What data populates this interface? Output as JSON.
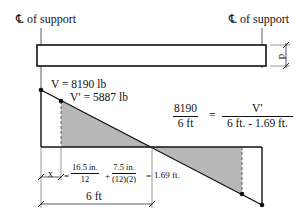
{
  "labels": {
    "left_support": "℄ of support",
    "right_support": "℄ of support",
    "depth": "d",
    "v_max": "V = 8190 lb",
    "v_prime": "V′ = 5887 lb",
    "x_label": "x",
    "span_label": "6 ft"
  },
  "equation_ratio": {
    "lhs_num": "8190",
    "lhs_den": "6 ft",
    "equals": "=",
    "rhs_num": "V′",
    "rhs_den": "6 ft. - 1.69 ft."
  },
  "equation_x": {
    "eq1": "=",
    "f1_num": "16.5 in.",
    "f1_den": "12",
    "plus": "+",
    "f2_num": "7.5 in.",
    "f2_den": "(12)(2)",
    "eq2": "=",
    "result": "1.69 ft."
  },
  "colors": {
    "line": "#111111",
    "shade": "#b8b8b8"
  }
}
